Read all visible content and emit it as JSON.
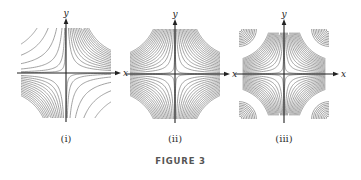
{
  "figure": {
    "caption": "FIGURE 3",
    "panels": [
      {
        "label": "(i)",
        "x_axis_label": "x",
        "y_axis_label": "y",
        "origin": [
          66,
          73
        ],
        "half_width": 45,
        "description": "Level curves xy = c; dense in quadrants I and III, sparse in II and IV",
        "dense_quadrants": [
          1,
          3
        ],
        "sparse_quadrants": [
          2,
          4
        ]
      },
      {
        "label": "(ii)",
        "x_axis_label": "x",
        "y_axis_label": "y",
        "origin": [
          175,
          74
        ],
        "half_width": 45,
        "description": "Level curves |xy| = c; dense evenly spaced hyperbolas in all four quadrants",
        "dense_quadrants": [
          1,
          2,
          3,
          4
        ],
        "sparse_quadrants": []
      },
      {
        "label": "(iii)",
        "x_axis_label": "x",
        "y_axis_label": "y",
        "origin": [
          284,
          74
        ],
        "half_width": 45,
        "description": "Hyperbolic level curves near axes plus concentric arcs centered at the four corners",
        "dense_quadrants": [
          1,
          2,
          3,
          4
        ],
        "sparse_quadrants": [],
        "corner_arcs": true
      }
    ],
    "colors": {
      "contour": "#8a8a8a",
      "axis": "#222222",
      "caption": "#555555"
    }
  }
}
